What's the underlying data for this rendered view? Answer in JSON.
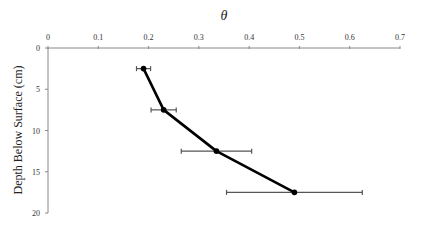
{
  "chart_data": {
    "type": "line",
    "title": "",
    "xlabel": "θ",
    "ylabel": "Depth Below Surface (cm)",
    "x_axis_position": "top",
    "y_axis_inverted": true,
    "xlim": [
      0,
      0.7
    ],
    "ylim": [
      0,
      20
    ],
    "x_ticks": [
      "0",
      "0.1",
      "0.2",
      "0.3",
      "0.4",
      "0.5",
      "0.6",
      "0.7"
    ],
    "y_ticks": [
      "0",
      "5",
      "10",
      "15",
      "20"
    ],
    "grid": false,
    "legend": null,
    "series": [
      {
        "name": "θ",
        "points": [
          {
            "x": 0.19,
            "y": 2.5,
            "x_err": 0.014
          },
          {
            "x": 0.23,
            "y": 7.5,
            "x_err": 0.025
          },
          {
            "x": 0.335,
            "y": 12.5,
            "x_err": 0.07
          },
          {
            "x": 0.49,
            "y": 17.5,
            "x_err": 0.135
          }
        ],
        "color": "#000000",
        "error_bar_color": "#555555",
        "marker": "circle"
      }
    ]
  }
}
